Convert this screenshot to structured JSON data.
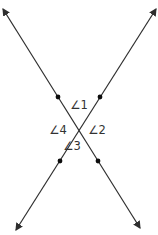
{
  "diagram": {
    "background_color": "#ffffff",
    "line_color": "#2e2e2e",
    "dot_color": "#0d0d0d",
    "label_color": "#333333",
    "lines": [
      {
        "name": "line-topleft-to-bottomright",
        "x1": 3,
        "y1": 9,
        "x2": 140,
        "y2": 228
      },
      {
        "name": "line-topright-to-bottomleft",
        "x1": 156,
        "y1": 9,
        "x2": 16,
        "y2": 230
      }
    ],
    "points": [
      {
        "name": "point-upper-left",
        "x": 58,
        "y": 97
      },
      {
        "name": "point-upper-right",
        "x": 100,
        "y": 97
      },
      {
        "name": "point-lower-left",
        "x": 60,
        "y": 161
      },
      {
        "name": "point-lower-right",
        "x": 98,
        "y": 161
      }
    ],
    "angle_labels": [
      {
        "name": "angle-1-label",
        "text": "∠1",
        "x": 79,
        "y": 109
      },
      {
        "name": "angle-2-label",
        "text": "∠2",
        "x": 97,
        "y": 134
      },
      {
        "name": "angle-3-label",
        "text": "∠3",
        "x": 72,
        "y": 150
      },
      {
        "name": "angle-4-label",
        "text": "∠4",
        "x": 58,
        "y": 134
      }
    ]
  }
}
